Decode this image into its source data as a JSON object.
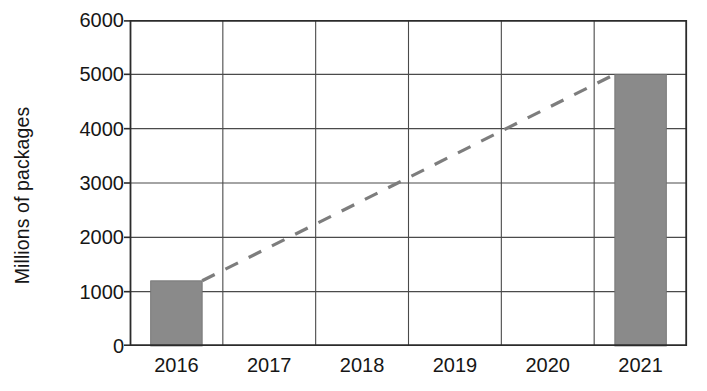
{
  "chart_data": {
    "type": "bar",
    "title": "",
    "subtitle": "",
    "xlabel": "",
    "ylabel": "Millions of packages",
    "categories": [
      "2016",
      "2017",
      "2018",
      "2019",
      "2020",
      "2021"
    ],
    "values": [
      1200,
      null,
      null,
      null,
      null,
      5000
    ],
    "series": [
      {
        "name": "Packages",
        "type": "bar",
        "values": [
          1200,
          null,
          null,
          null,
          null,
          5000
        ]
      },
      {
        "name": "Projected trend",
        "type": "line",
        "style": "dashed",
        "x": [
          "2016",
          "2021"
        ],
        "values": [
          1200,
          5000
        ]
      }
    ],
    "ylim": [
      0,
      6000
    ],
    "ytick_labels": [
      "0",
      "1000",
      "2000",
      "3000",
      "4000",
      "5000",
      "6000"
    ],
    "yticks": [
      0,
      1000,
      2000,
      3000,
      4000,
      5000,
      6000
    ],
    "ystep": 1000,
    "grid": {
      "horizontal": true,
      "vertical": true
    },
    "legend": {
      "visible": false,
      "position": "none"
    },
    "annotations": []
  },
  "style": {
    "bar_fill": "#8a8a8a",
    "bar_stroke": "#6f6f6f",
    "grid_color": "#4a4a4a",
    "axis_color": "#2b2b2b",
    "trend_color": "#7d7d7d",
    "background": "#ffffff",
    "text_color": "#161616"
  }
}
